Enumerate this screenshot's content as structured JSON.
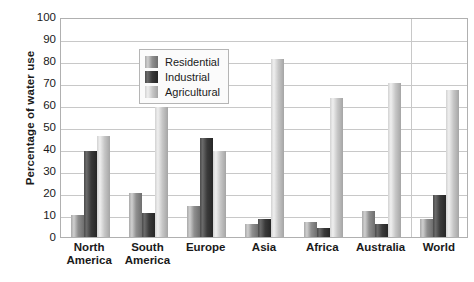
{
  "chart_data": {
    "type": "bar",
    "title": "",
    "xlabel": "",
    "ylabel": "Percentage of water use",
    "ylim": [
      0,
      100
    ],
    "ytick_step": 10,
    "ytick_labels": [
      "100",
      "90",
      "80",
      "70",
      "60",
      "50",
      "40",
      "30",
      "20",
      "10",
      "0"
    ],
    "grid": true,
    "legend_position": "upper-left-inside",
    "categories": [
      "North America",
      "South America",
      "Europe",
      "Asia",
      "Africa",
      "Australia",
      "World"
    ],
    "category_lines": [
      [
        "North",
        "America"
      ],
      [
        "South",
        "America"
      ],
      [
        "Europe",
        ""
      ],
      [
        "Asia",
        ""
      ],
      [
        "Africa",
        ""
      ],
      [
        "Australia",
        ""
      ],
      [
        "World",
        ""
      ]
    ],
    "series": [
      {
        "name": "Residential",
        "color": "#8f8f8f",
        "values": [
          10,
          20,
          14,
          6,
          7,
          12,
          8
        ]
      },
      {
        "name": "Industrial",
        "color": "#3a3a3a",
        "values": [
          39,
          11,
          45,
          8,
          4,
          6,
          19
        ]
      },
      {
        "name": "Agricultural",
        "color": "#c6c6c6",
        "values": [
          46,
          59,
          39,
          81,
          63,
          70,
          67
        ]
      }
    ],
    "separator_after_category_index": 5
  },
  "legend": {
    "items": [
      {
        "label": "Residential",
        "swatch": "residential"
      },
      {
        "label": "Industrial",
        "swatch": "industrial"
      },
      {
        "label": "Agricultural",
        "swatch": "agricultural"
      }
    ]
  },
  "axis": {
    "y_title": "Percentage of water use"
  }
}
